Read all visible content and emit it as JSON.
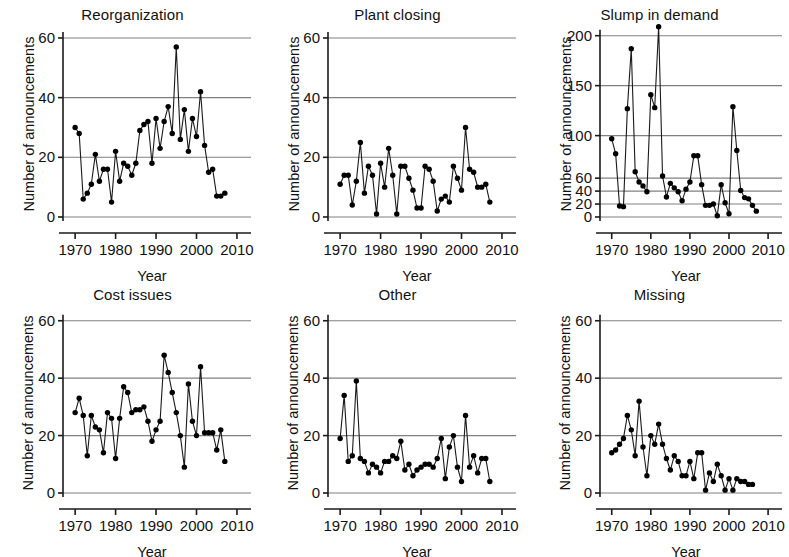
{
  "figure": {
    "title": "",
    "panel_count": 6,
    "layout": "2 rows x 3 columns",
    "axis_label_x": "Year",
    "axis_label_y": "Number of announcements"
  },
  "chart_data": [
    {
      "type": "line",
      "title": "Reorganization",
      "xlabel": "Year",
      "ylabel": "Number of announcements",
      "xlim": [
        1967,
        2011
      ],
      "ylim": [
        0,
        62
      ],
      "xticks": [
        1970,
        1980,
        1990,
        2000,
        2010
      ],
      "yticks": [
        0,
        20,
        40,
        60
      ],
      "grid": "horizontal",
      "marker": "filled-circle",
      "x": [
        1970,
        1971,
        1972,
        1973,
        1974,
        1975,
        1976,
        1977,
        1978,
        1979,
        1980,
        1981,
        1982,
        1983,
        1984,
        1985,
        1986,
        1987,
        1988,
        1989,
        1990,
        1991,
        1992,
        1993,
        1994,
        1995,
        1996,
        1997,
        1998,
        1999,
        2000,
        2001,
        2002,
        2003,
        2004,
        2005,
        2006,
        2007
      ],
      "values": [
        30,
        28,
        6,
        8,
        11,
        21,
        12,
        16,
        16,
        5,
        22,
        12,
        18,
        17,
        14,
        18,
        29,
        31,
        32,
        18,
        33,
        23,
        32,
        37,
        28,
        57,
        26,
        36,
        22,
        33,
        27,
        42,
        24,
        15,
        16,
        7,
        7,
        8,
        11
      ]
    },
    {
      "type": "line",
      "title": "Plant closing",
      "xlabel": "Year",
      "ylabel": "Number of announcements",
      "xlim": [
        1967,
        2011
      ],
      "ylim": [
        0,
        62
      ],
      "xticks": [
        1970,
        1980,
        1990,
        2000,
        2010
      ],
      "yticks": [
        0,
        20,
        40,
        60
      ],
      "grid": "horizontal",
      "marker": "filled-circle",
      "x": [
        1970,
        1971,
        1972,
        1973,
        1974,
        1975,
        1976,
        1977,
        1978,
        1979,
        1980,
        1981,
        1982,
        1983,
        1984,
        1985,
        1986,
        1987,
        1988,
        1989,
        1990,
        1991,
        1992,
        1993,
        1994,
        1995,
        1996,
        1997,
        1998,
        1999,
        2000,
        2001,
        2002,
        2003,
        2004,
        2005,
        2006,
        2007
      ],
      "values": [
        11,
        14,
        14,
        4,
        12,
        25,
        8,
        17,
        14,
        1,
        18,
        10,
        23,
        14,
        1,
        17,
        17,
        13,
        9,
        3,
        3,
        17,
        16,
        12,
        2,
        6,
        7,
        5,
        17,
        13,
        9,
        30,
        16,
        15,
        10,
        10,
        11,
        5
      ]
    },
    {
      "type": "line",
      "title": "Slump in demand",
      "xlabel": "Year",
      "ylabel": "Number of announcements",
      "xlim": [
        1967,
        2011
      ],
      "ylim": [
        0,
        215
      ],
      "xticks": [
        1970,
        1980,
        1990,
        2000,
        2010
      ],
      "yticks": [
        0,
        20,
        40,
        60,
        100,
        150,
        200
      ],
      "grid": "horizontal",
      "marker": "filled-circle",
      "note": "y-axis tick spacing is non-uniform / compressed above 60",
      "x": [
        1970,
        1971,
        1972,
        1973,
        1974,
        1975,
        1976,
        1977,
        1978,
        1979,
        1980,
        1981,
        1982,
        1983,
        1984,
        1985,
        1986,
        1987,
        1988,
        1989,
        1990,
        1991,
        1992,
        1993,
        1994,
        1995,
        1996,
        1997,
        1998,
        1999,
        2000,
        2001,
        2002,
        2003,
        2004,
        2005,
        2006,
        2007
      ],
      "values": [
        97,
        83,
        17,
        16,
        127,
        187,
        66,
        54,
        48,
        39,
        141,
        128,
        209,
        62,
        31,
        52,
        45,
        39,
        25,
        43,
        54,
        81,
        81,
        50,
        18,
        18,
        20,
        2,
        50,
        22,
        5,
        129,
        86,
        41,
        30,
        28,
        18,
        9
      ]
    },
    {
      "type": "line",
      "title": "Cost issues",
      "xlabel": "Year",
      "ylabel": "Number of announcements",
      "xlim": [
        1967,
        2011
      ],
      "ylim": [
        0,
        62
      ],
      "xticks": [
        1970,
        1980,
        1990,
        2000,
        2010
      ],
      "yticks": [
        0,
        20,
        40,
        60
      ],
      "grid": "horizontal",
      "marker": "filled-circle",
      "x": [
        1970,
        1971,
        1972,
        1973,
        1974,
        1975,
        1976,
        1977,
        1978,
        1979,
        1980,
        1981,
        1982,
        1983,
        1984,
        1985,
        1986,
        1987,
        1988,
        1989,
        1990,
        1991,
        1992,
        1993,
        1994,
        1995,
        1996,
        1997,
        1998,
        1999,
        2000,
        2001,
        2002,
        2003,
        2004,
        2005,
        2006,
        2007
      ],
      "values": [
        28,
        33,
        27,
        13,
        27,
        23,
        22,
        14,
        28,
        26,
        12,
        26,
        37,
        35,
        28,
        29,
        29,
        30,
        25,
        18,
        22,
        25,
        48,
        42,
        35,
        28,
        20,
        9,
        38,
        25,
        20,
        44,
        21,
        21,
        21,
        15,
        22,
        11
      ]
    },
    {
      "type": "line",
      "title": "Other",
      "xlabel": "Year",
      "ylabel": "Number of announcements",
      "xlim": [
        1967,
        2011
      ],
      "ylim": [
        0,
        62
      ],
      "xticks": [
        1970,
        1980,
        1990,
        2000,
        2010
      ],
      "yticks": [
        0,
        20,
        40,
        60
      ],
      "grid": "horizontal",
      "marker": "filled-circle",
      "x": [
        1970,
        1971,
        1972,
        1973,
        1974,
        1975,
        1976,
        1977,
        1978,
        1979,
        1980,
        1981,
        1982,
        1983,
        1984,
        1985,
        1986,
        1987,
        1988,
        1989,
        1990,
        1991,
        1992,
        1993,
        1994,
        1995,
        1996,
        1997,
        1998,
        1999,
        2000,
        2001,
        2002,
        2003,
        2004,
        2005,
        2006,
        2007
      ],
      "values": [
        19,
        34,
        11,
        13,
        39,
        12,
        11,
        7,
        10,
        9,
        7,
        11,
        11,
        13,
        12,
        18,
        8,
        10,
        6,
        8,
        9,
        10,
        10,
        9,
        12,
        19,
        5,
        16,
        20,
        9,
        4,
        27,
        9,
        13,
        7,
        12,
        12,
        4
      ]
    },
    {
      "type": "line",
      "title": "Missing",
      "xlabel": "Year",
      "ylabel": "Number of announcements",
      "xlim": [
        1967,
        2011
      ],
      "ylim": [
        0,
        62
      ],
      "xticks": [
        1970,
        1980,
        1990,
        2000,
        2010
      ],
      "yticks": [
        0,
        20,
        40,
        60
      ],
      "grid": "horizontal",
      "marker": "filled-circle",
      "x": [
        1970,
        1971,
        1972,
        1973,
        1974,
        1975,
        1976,
        1977,
        1978,
        1979,
        1980,
        1981,
        1982,
        1983,
        1984,
        1985,
        1986,
        1987,
        1988,
        1989,
        1990,
        1991,
        1992,
        1993,
        1994,
        1995,
        1996,
        1997,
        1998,
        1999,
        2000,
        2001,
        2002,
        2003,
        2004,
        2005,
        2006
      ],
      "values": [
        14,
        15,
        17,
        19,
        27,
        22,
        13,
        32,
        16,
        6,
        20,
        17,
        24,
        17,
        12,
        8,
        13,
        11,
        6,
        6,
        11,
        5,
        14,
        14,
        1,
        7,
        4,
        10,
        6,
        1,
        5,
        1,
        5,
        4,
        4,
        3,
        3
      ]
    }
  ],
  "style": {
    "line_color": "#1a1a1a",
    "marker_color": "#000000",
    "grid_color": "#808080",
    "axis_color": "#1a1a1a",
    "background": "#ffffff"
  }
}
